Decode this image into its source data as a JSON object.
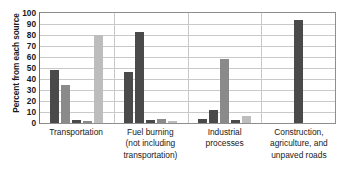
{
  "chart_data": {
    "type": "bar",
    "title": "",
    "xlabel": "",
    "ylabel": "Percent from each source",
    "ylim": [
      0,
      100
    ],
    "ytick_step": 10,
    "yticks": [
      "100",
      "90",
      "80",
      "70",
      "60",
      "50",
      "40",
      "30",
      "20",
      "10",
      "0"
    ],
    "grid": true,
    "legend": "none",
    "categories": [
      "Transportation",
      "Fuel burning (not including transportation)",
      "Industrial processes",
      "Construction, agriculture, and unpaved roads"
    ],
    "category_lines": [
      [
        "Transportation"
      ],
      [
        "Fuel burning",
        "(not including",
        "transportation)"
      ],
      [
        "Industrial",
        "processes"
      ],
      [
        "Construction,",
        "agriculture, and",
        "unpaved roads"
      ]
    ],
    "colors": {
      "dark": "#4a4a4a",
      "medium": "#8a8a8a",
      "light": "#bdbdbd",
      "axis": "#8e8e8e",
      "grid": "#c9c9c9",
      "text": "#1a1a1a"
    },
    "groups": [
      {
        "category": "Transportation",
        "bars": [
          {
            "value": 48,
            "shade": "dark"
          },
          {
            "value": 35,
            "shade": "medium"
          },
          {
            "value": 3,
            "shade": "dark"
          },
          {
            "value": 2,
            "shade": "medium"
          },
          {
            "value": 80,
            "shade": "light"
          }
        ]
      },
      {
        "category": "Fuel burning (not including transportation)",
        "bars": [
          {
            "value": 46,
            "shade": "dark"
          },
          {
            "value": 83,
            "shade": "dark"
          },
          {
            "value": 3,
            "shade": "dark"
          },
          {
            "value": 4,
            "shade": "medium"
          },
          {
            "value": 2,
            "shade": "light"
          }
        ]
      },
      {
        "category": "Industrial processes",
        "bars": [
          {
            "value": 4,
            "shade": "dark"
          },
          {
            "value": 12,
            "shade": "dark"
          },
          {
            "value": 58,
            "shade": "medium"
          },
          {
            "value": 3,
            "shade": "dark"
          },
          {
            "value": 6,
            "shade": "light"
          }
        ]
      },
      {
        "category": "Construction, agriculture, and unpaved roads",
        "bars": [
          {
            "value": 94,
            "shade": "dark"
          }
        ]
      }
    ]
  }
}
